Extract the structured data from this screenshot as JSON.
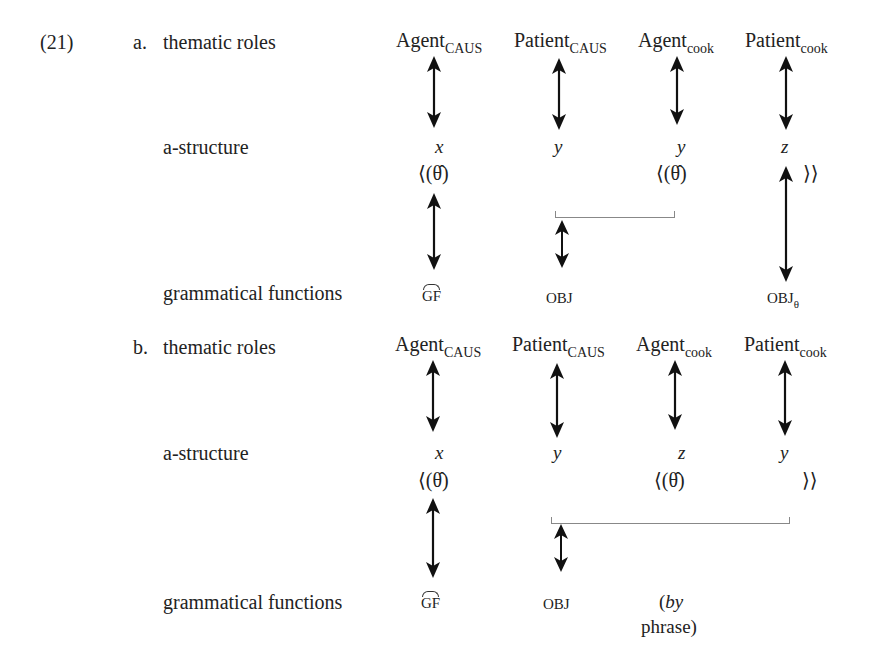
{
  "example": {
    "number": "(21)",
    "part_a": {
      "letter": "a.",
      "row_labels": {
        "thematic_roles": "thematic roles",
        "a_structure": "a-structure",
        "grammatical_functions": "grammatical functions"
      },
      "roles": [
        {
          "name": "Agent",
          "sub": "CAUS"
        },
        {
          "name": "Patient",
          "sub": "CAUS"
        },
        {
          "name": "Agent",
          "sub": "cook"
        },
        {
          "name": "Patient",
          "sub": "cook"
        }
      ],
      "variables": [
        "x",
        "y",
        "y",
        "z"
      ],
      "theta_open_1": "⟨(θ̂)",
      "theta_open_2": "⟨(θ̂)",
      "theta_close": "⟩⟩",
      "functions": {
        "gf": "GF",
        "obj": "OBJ",
        "obj_theta": "OBJ",
        "obj_theta_sub": "θ"
      }
    },
    "part_b": {
      "letter": "b.",
      "row_labels": {
        "thematic_roles": "thematic roles",
        "a_structure": "a-structure",
        "grammatical_functions": "grammatical functions"
      },
      "roles": [
        {
          "name": "Agent",
          "sub": "CAUS"
        },
        {
          "name": "Patient",
          "sub": "CAUS"
        },
        {
          "name": "Agent",
          "sub": "cook"
        },
        {
          "name": "Patient",
          "sub": "cook"
        }
      ],
      "variables": [
        "x",
        "y",
        "z",
        "y"
      ],
      "theta_open_1": "⟨(θ̂)",
      "theta_open_2": "⟨(θ̂)",
      "theta_close": "⟩⟩",
      "functions": {
        "gf": "GF",
        "obj": "OBJ",
        "by_phrase_1": "(by",
        "by_phrase_2": "phrase)"
      }
    }
  }
}
